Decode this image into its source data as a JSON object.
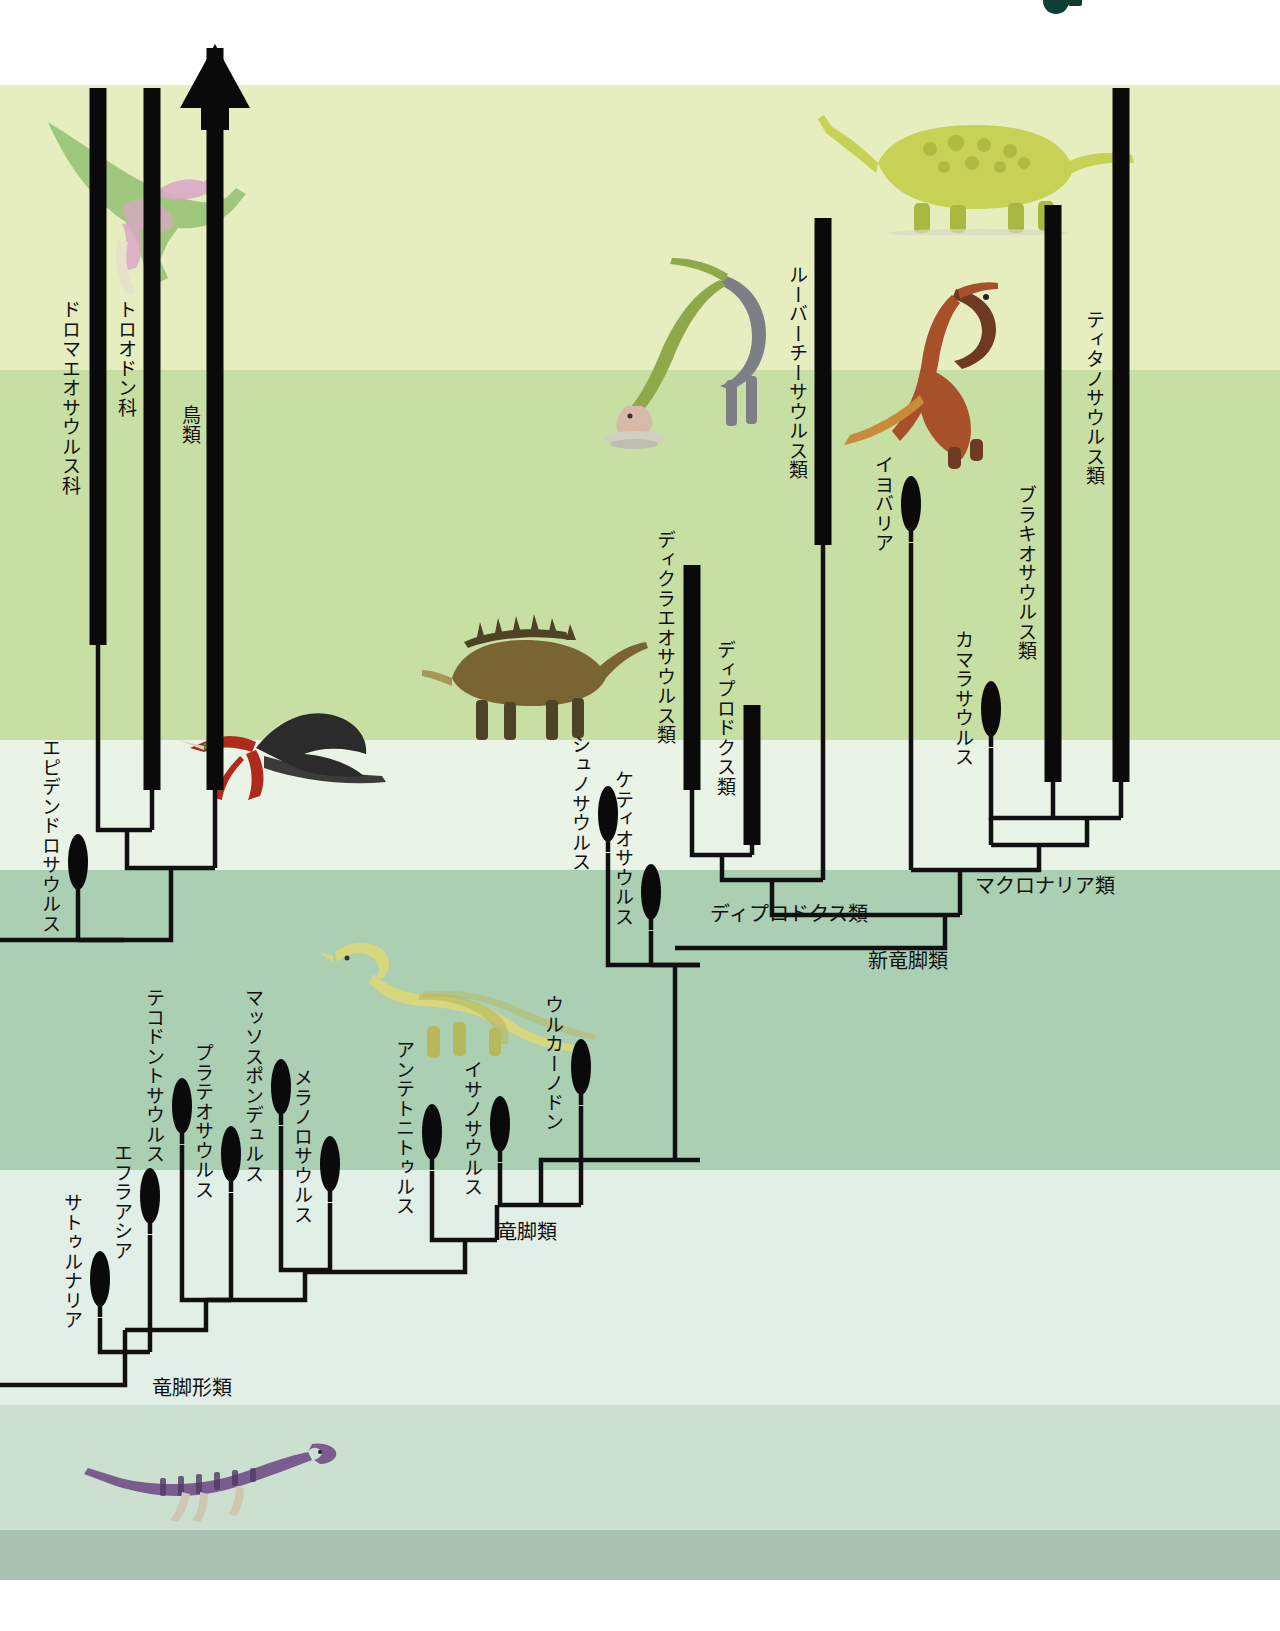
{
  "figure": {
    "type": "cladogram",
    "orientation": "time flows upward; terminal taxa at top"
  },
  "background_bands": [
    {
      "name": "white-top",
      "top": 0,
      "height": 85,
      "color": "#ffffff"
    },
    {
      "name": "pale-yellow-green",
      "top": 85,
      "height": 285,
      "color": "#e6eec0"
    },
    {
      "name": "light-green",
      "top": 370,
      "height": 370,
      "color": "#c8dfa4"
    },
    {
      "name": "very-pale-green",
      "top": 740,
      "height": 130,
      "color": "#e9f3e6"
    },
    {
      "name": "medium-green",
      "top": 870,
      "height": 300,
      "color": "#abcfb2"
    },
    {
      "name": "pale-mint",
      "top": 1170,
      "height": 235,
      "color": "#e2efe6"
    },
    {
      "name": "soft-green",
      "top": 1405,
      "height": 125,
      "color": "#cbe0cf"
    },
    {
      "name": "gray-green",
      "top": 1530,
      "height": 50,
      "color": "#a9c2b1"
    },
    {
      "name": "white-bottom",
      "top": 1580,
      "height": 51,
      "color": "#ffffff"
    }
  ],
  "colors": {
    "line": "#101010",
    "bar": "#0a0a0a",
    "label_text": "#101010",
    "corner_mark": "#0d4035"
  },
  "arrow": {
    "name": "birds-continuing-arrow",
    "meaning": "lineage continues to present day"
  },
  "taxa": [
    {
      "id": "dromaeosauridae",
      "label": "ドロマエオサウルス科",
      "tip_style": "bar",
      "x": 98,
      "bar_top": 88,
      "bar_bottom": 645,
      "label_x": 60,
      "label_y": 300
    },
    {
      "id": "troodontidae",
      "label": "トロオドン科",
      "tip_style": "bar",
      "x": 152,
      "bar_top": 88,
      "bar_bottom": 790,
      "label_x": 116,
      "label_y": 300
    },
    {
      "id": "aves",
      "label": "鳥類",
      "tip_style": "arrow",
      "x": 215,
      "bar_top": 48,
      "bar_bottom": 790,
      "label_x": 180,
      "label_y": 405
    },
    {
      "id": "epidendrosaurus",
      "label": "エピデンドロサウルス",
      "tip_style": "ellipse",
      "x": 78,
      "tip_y": 888,
      "label_x": 40,
      "label_y": 738
    },
    {
      "id": "saturnalia",
      "label": "サトゥルナリア",
      "tip_style": "ellipse",
      "x": 100,
      "tip_y": 1305,
      "label_x": 62,
      "label_y": 1193
    },
    {
      "id": "efraasia",
      "label": "エフラアシア",
      "tip_style": "ellipse",
      "x": 150,
      "tip_y": 1222,
      "label_x": 112,
      "label_y": 1143
    },
    {
      "id": "thecodontosaurus",
      "label": "テコドントサウルス",
      "tip_style": "ellipse",
      "x": 182,
      "tip_y": 1132,
      "label_x": 144,
      "label_y": 988
    },
    {
      "id": "plateosaurus",
      "label": "プラテオサウルス",
      "tip_style": "ellipse",
      "x": 231,
      "tip_y": 1180,
      "label_x": 193,
      "label_y": 1043
    },
    {
      "id": "massospondylus",
      "label": "マッソスポンデュルス",
      "tip_style": "ellipse",
      "x": 281,
      "tip_y": 1113,
      "label_x": 243,
      "label_y": 988
    },
    {
      "id": "melanorosaurus",
      "label": "メラノロサウルス",
      "tip_style": "ellipse",
      "x": 330,
      "tip_y": 1190,
      "label_x": 292,
      "label_y": 1068
    },
    {
      "id": "antetonitrus",
      "label": "アンテトニトゥルス",
      "tip_style": "ellipse",
      "x": 432,
      "tip_y": 1158,
      "label_x": 394,
      "label_y": 1040
    },
    {
      "id": "isanosaurus",
      "label": "イサノサウルス",
      "tip_style": "ellipse",
      "x": 500,
      "tip_y": 1150,
      "label_x": 462,
      "label_y": 1060
    },
    {
      "id": "vulcanodon",
      "label": "ウルカーノドン",
      "tip_style": "ellipse",
      "x": 581,
      "tip_y": 1093,
      "label_x": 543,
      "label_y": 995
    },
    {
      "id": "shunosaurus",
      "label": "シュノサウルス",
      "tip_style": "ellipse",
      "x": 608,
      "tip_y": 840,
      "label_x": 570,
      "label_y": 735
    },
    {
      "id": "cetiosaurus",
      "label": "ケティオサウルス",
      "tip_style": "ellipse",
      "x": 651,
      "tip_y": 918,
      "label_x": 613,
      "label_y": 770
    },
    {
      "id": "dicraeosauridae",
      "label": "ディクラエオサウルス類",
      "tip_style": "bar",
      "x": 692,
      "bar_top": 565,
      "bar_bottom": 790,
      "label_x": 655,
      "label_y": 530
    },
    {
      "id": "diplodocidae",
      "label": "ディプロドクス類",
      "tip_style": "bar",
      "x": 752,
      "bar_top": 705,
      "bar_bottom": 845,
      "label_x": 715,
      "label_y": 640
    },
    {
      "id": "rebbachisauridae",
      "label": "ルーバーチーサウルス類",
      "tip_style": "bar",
      "x": 823,
      "bar_top": 218,
      "bar_bottom": 545,
      "label_x": 787,
      "label_y": 265
    },
    {
      "id": "euhelopus",
      "label": "イヨバリア",
      "tip_style": "ellipse",
      "x": 911,
      "tip_y": 530,
      "label_x": 873,
      "label_y": 455
    },
    {
      "id": "camarasaurus",
      "label": "カマラサウルス",
      "tip_style": "ellipse",
      "x": 991,
      "tip_y": 735,
      "label_x": 953,
      "label_y": 630
    },
    {
      "id": "brachiosauridae",
      "label": "ブラキオサウルス類",
      "tip_style": "bar",
      "x": 1053,
      "bar_top": 205,
      "bar_bottom": 782,
      "label_x": 1016,
      "label_y": 485
    },
    {
      "id": "titanosauria",
      "label": "ティタノサウルス類",
      "tip_style": "bar",
      "x": 1121,
      "bar_top": 88,
      "bar_bottom": 782,
      "label_x": 1084,
      "label_y": 310
    }
  ],
  "clade_labels": [
    {
      "id": "sauropodomorpha",
      "label": "竜脚形類",
      "x": 152,
      "y": 1372
    },
    {
      "id": "sauropoda",
      "label": "竜脚類",
      "x": 497,
      "y": 1216
    },
    {
      "id": "diplodocoidea",
      "label": "ディプロドクス類",
      "x": 710,
      "y": 898
    },
    {
      "id": "macronaria",
      "label": "マクロナリア類",
      "x": 975,
      "y": 870
    },
    {
      "id": "neosauropoda",
      "label": "新竜脚類",
      "x": 868,
      "y": 945
    }
  ],
  "illustrations": [
    {
      "id": "dromaeosaur-illustration",
      "name": "feathered-dromaeosaur",
      "x": 40,
      "y": 110,
      "w": 230,
      "h": 190,
      "palette": [
        "#9cc47a",
        "#d9a8c6",
        "#e6e0c8"
      ]
    },
    {
      "id": "archaeopteryx-illustration",
      "name": "archaeopteryx-black-red",
      "x": 160,
      "y": 690,
      "w": 230,
      "h": 130,
      "palette": [
        "#2b2b2b",
        "#b02a1c",
        "#4e8f3a"
      ]
    },
    {
      "id": "dicraeosaur-illustration",
      "name": "spined-sauropod-brown",
      "x": 420,
      "y": 600,
      "w": 230,
      "h": 150,
      "palette": [
        "#7a6432",
        "#4e4324",
        "#a8955a"
      ]
    },
    {
      "id": "rebbachisaur-illustration",
      "name": "grazing-sauropod-green",
      "x": 600,
      "y": 250,
      "w": 190,
      "h": 200,
      "palette": [
        "#8fa84a",
        "#7d7f86",
        "#d8b9a8"
      ]
    },
    {
      "id": "titanosaur-illustration",
      "name": "armoured-titanosaur",
      "x": 810,
      "y": 105,
      "w": 330,
      "h": 130,
      "palette": [
        "#c6d256",
        "#a9b840"
      ]
    },
    {
      "id": "camarasaur-illustration",
      "name": "rearing-sauropod-red",
      "x": 830,
      "y": 275,
      "w": 200,
      "h": 195,
      "palette": [
        "#a8502a",
        "#c98a3c",
        "#6e3a22"
      ]
    },
    {
      "id": "prosauropod-illustration",
      "name": "prosauropod-yellow",
      "x": 275,
      "y": 930,
      "w": 325,
      "h": 130,
      "palette": [
        "#d8d77e",
        "#b8b85a"
      ]
    },
    {
      "id": "saturnalia-illustration",
      "name": "basal-sauropodomorph-purple",
      "x": 80,
      "y": 1430,
      "w": 260,
      "h": 95,
      "palette": [
        "#7a5c8f",
        "#4f3a63",
        "#cfc7b0"
      ]
    }
  ]
}
